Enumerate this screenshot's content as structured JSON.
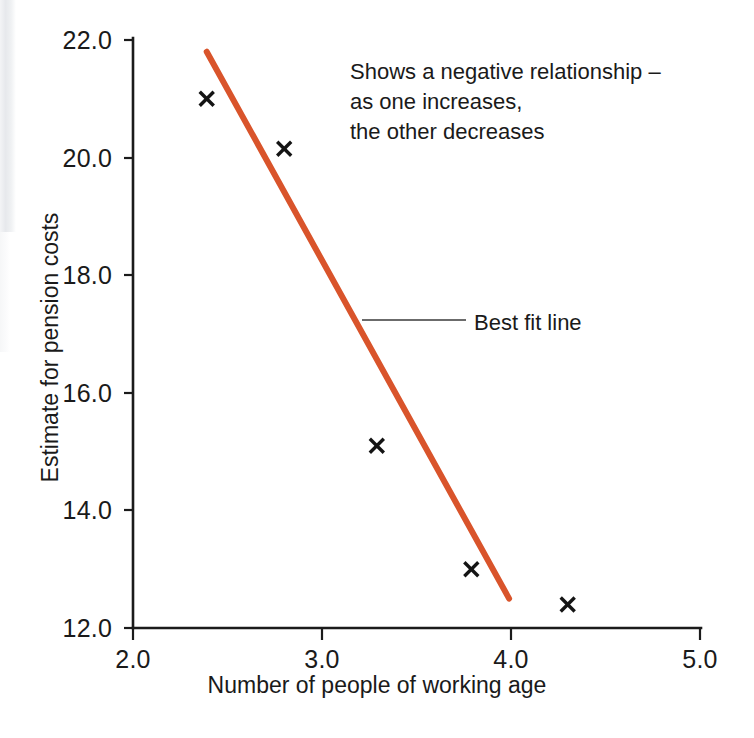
{
  "chart_data": {
    "type": "scatter",
    "title": "",
    "xlabel": "Number of people of working age",
    "ylabel": "Estimate for pension costs",
    "xlim": [
      2.0,
      5.0
    ],
    "ylim": [
      12.0,
      22.0
    ],
    "xticks": [
      "2.0",
      "3.0",
      "4.0",
      "5.0"
    ],
    "yticks": [
      "12.0",
      "14.0",
      "16.0",
      "18.0",
      "20.0",
      "22.0"
    ],
    "grid": false,
    "legend_position": "none",
    "marker_style": "x",
    "series": [
      {
        "name": "Observations",
        "points": [
          {
            "x": 2.39,
            "y": 21.0
          },
          {
            "x": 2.8,
            "y": 20.15
          },
          {
            "x": 3.29,
            "y": 15.1
          },
          {
            "x": 3.79,
            "y": 13.0
          },
          {
            "x": 4.3,
            "y": 12.4
          }
        ]
      }
    ],
    "trend_line": {
      "name": "Best fit line",
      "color": "#D9542B",
      "x_start": 2.39,
      "y_start": 21.8,
      "x_end": 3.99,
      "y_end": 12.5
    },
    "annotations": [
      {
        "name": "relationship-note",
        "lines": [
          "Shows a negative relationship –",
          "as one increases,",
          "the other decreases"
        ]
      },
      {
        "name": "best-fit-callout",
        "label": "Best fit line"
      }
    ]
  },
  "axis": {
    "x_title": "Number of people of working age",
    "y_title": "Estimate for pension costs",
    "x_tick_labels": [
      "2.0",
      "3.0",
      "4.0",
      "5.0"
    ],
    "y_tick_labels": [
      "12.0",
      "14.0",
      "16.0",
      "18.0",
      "20.0",
      "22.0"
    ]
  },
  "annotation": {
    "line1": "Shows a negative relationship –",
    "line2": "as one increases,",
    "line3": "the other decreases"
  },
  "callout": {
    "best_fit_label": "Best fit line"
  },
  "colors": {
    "trend_line": "#D9542B",
    "axis": "#1b1b1b",
    "text": "#1a1a1a",
    "background": "#ffffff"
  }
}
